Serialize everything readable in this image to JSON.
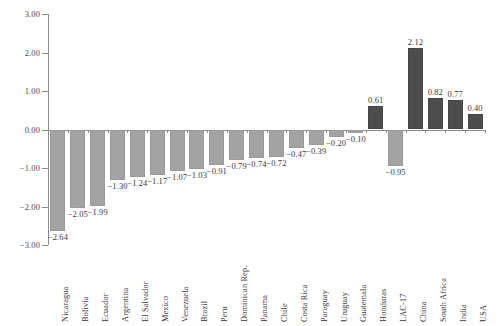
{
  "chart_data": {
    "type": "bar",
    "title": "",
    "subtitle": "",
    "xlabel": "",
    "ylabel": "",
    "ylim": [
      -3.0,
      3.0
    ],
    "yticks": [
      3.0,
      2.0,
      1.0,
      0.0,
      -1.0,
      -2.0,
      -3.0
    ],
    "ytick_labels": [
      "3.00",
      "2.00",
      "1.00",
      "0.00",
      "−1.00",
      "−2.00",
      "−3.00"
    ],
    "grid": false,
    "legend": "none",
    "categories": [
      "Nicaragua",
      "Bolivia",
      "Ecuador",
      "Argentina",
      "El Salvador",
      "Mexico",
      "Venezuela",
      "Brazil",
      "Peru",
      "Dominican Rep.",
      "Panama",
      "Chile",
      "Costa Rica",
      "Paraguay",
      "Uruguay",
      "Guatemala",
      "Honduras",
      "LAC-17",
      "China",
      "South Africa",
      "India",
      "USA"
    ],
    "values": [
      -2.64,
      -2.05,
      -1.99,
      -1.3,
      -1.24,
      -1.17,
      -1.07,
      -1.03,
      -0.91,
      -0.79,
      -0.74,
      -0.72,
      -0.47,
      -0.39,
      -0.2,
      -0.1,
      0.61,
      -0.95,
      2.12,
      0.82,
      0.77,
      0.4
    ],
    "data_labels": [
      "−2.64",
      "−2.05",
      "−1.99",
      "−1.30",
      "−1.24",
      "−1.17",
      "−1.07",
      "−1.03",
      "−0.91",
      "−0.79",
      "−0.74",
      "−0.72",
      "−0.47",
      "−0.39",
      "−0.20",
      "−0.10",
      "0.61",
      "−0.95",
      "2.12",
      "0.82",
      "0.77",
      "0.40"
    ],
    "colors": {
      "negative_bar": "#a3a3a3",
      "positive_bar": "#4d4d4d",
      "axis": "#8c8c8c",
      "text": "#3a3a3a",
      "background": "#ffffff"
    }
  }
}
